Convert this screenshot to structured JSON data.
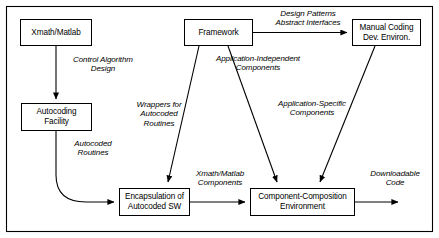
{
  "diagram": {
    "frame": {
      "stroke": "#000000"
    },
    "nodes": [
      {
        "id": "xmath-matlab",
        "label": "Xmath/Matlab",
        "x": 20,
        "y": 19,
        "w": 72,
        "h": 27
      },
      {
        "id": "autocoding-facility",
        "label": "Autocoding\nFacility",
        "x": 21,
        "y": 103,
        "w": 71,
        "h": 28
      },
      {
        "id": "framework",
        "label": "Framework",
        "x": 184,
        "y": 19,
        "w": 69,
        "h": 27
      },
      {
        "id": "manual-coding",
        "label": "Manual Coding\nDev. Environ.",
        "x": 352,
        "y": 19,
        "w": 69,
        "h": 27
      },
      {
        "id": "encapsulation",
        "label": "Encapsulation of\nAutocoded SW",
        "x": 119,
        "y": 188,
        "w": 71,
        "h": 28
      },
      {
        "id": "component-composition",
        "label": "Component-Composition\nEnvironment",
        "x": 250,
        "y": 188,
        "w": 105,
        "h": 28
      }
    ],
    "edge_labels": [
      {
        "id": "control-algorithm-design",
        "text": "Control Algorithm\nDesign",
        "x": 57,
        "y": 55,
        "w": 92,
        "align": "center"
      },
      {
        "id": "autocoded-routines",
        "text": "Autocoded\nRoutines",
        "x": 56,
        "y": 139,
        "w": 74,
        "align": "center"
      },
      {
        "id": "wrappers-for-autocoded-routines",
        "text": "Wrappers for\nAutocoded\nRoutines",
        "x": 124,
        "y": 100,
        "w": 70,
        "align": "center"
      },
      {
        "id": "design-patterns",
        "text": "Design Patterns\nAbstract Interfaces",
        "x": 262,
        "y": 9,
        "w": 92,
        "align": "center"
      },
      {
        "id": "application-independent",
        "text": "Application-Independent\nComponents",
        "x": 203,
        "y": 54,
        "w": 110,
        "align": "center"
      },
      {
        "id": "application-specific",
        "text": "Application-Specific\nComponents",
        "x": 265,
        "y": 99,
        "w": 94,
        "align": "center"
      },
      {
        "id": "xmath-matlab-components",
        "text": "Xmath/Matlab\nComponents",
        "x": 189,
        "y": 169,
        "w": 62,
        "align": "center"
      },
      {
        "id": "downloadable-code",
        "text": "Downloadable\nCode",
        "x": 364,
        "y": 169,
        "w": 62,
        "align": "center"
      }
    ],
    "connections": [
      {
        "id": "xmath-to-autocoding",
        "from": "xmath-matlab",
        "to": "autocoding-facility",
        "style": "straight-down-arrow"
      },
      {
        "id": "autocoding-to-encapsulation",
        "from": "autocoding-facility",
        "to": "encapsulation",
        "style": "curved-arrow"
      },
      {
        "id": "framework-to-manual-coding",
        "from": "framework",
        "to": "manual-coding",
        "style": "straight-right-arrow"
      },
      {
        "id": "framework-to-encapsulation",
        "from": "framework",
        "to": "encapsulation",
        "style": "diagonal-arrow"
      },
      {
        "id": "framework-to-composition",
        "from": "framework",
        "to": "component-composition",
        "style": "diagonal-arrow"
      },
      {
        "id": "manual-coding-to-composition",
        "from": "manual-coding",
        "to": "component-composition",
        "style": "diagonal-arrow"
      },
      {
        "id": "encapsulation-to-composition",
        "from": "encapsulation",
        "to": "component-composition",
        "style": "straight-right-arrow"
      },
      {
        "id": "composition-to-output",
        "from": "component-composition",
        "to": "downloadable-code",
        "style": "straight-right-arrow"
      }
    ]
  }
}
